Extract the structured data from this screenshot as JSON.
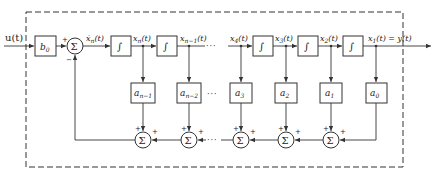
{
  "diagram": {
    "title": "",
    "type": "block-diagram",
    "input_label": "u(t)",
    "output_label": "x₁(t) = y(t)",
    "input_gain": {
      "label": "b",
      "sub": "0"
    },
    "main_sum": {
      "symbol": "Σ",
      "plus_sign": "+",
      "minus_sign": "−"
    },
    "derivative_label": {
      "text": "ẋ",
      "sub": "n",
      "arg": "(t)"
    },
    "integrator_symbol": "∫",
    "state_labels": [
      {
        "text": "x",
        "sub": "n",
        "arg": "(t)"
      },
      {
        "text": "x",
        "sub": "n−1",
        "arg": "(t)"
      },
      {
        "text": "x",
        "sub": "4",
        "arg": "(t)"
      },
      {
        "text": "x",
        "sub": "3",
        "arg": "(t)"
      },
      {
        "text": "x",
        "sub": "2",
        "arg": "(t)"
      },
      {
        "text": "x",
        "sub": "1",
        "arg": "(t) = y(t)"
      }
    ],
    "feedback_gains": [
      {
        "label": "a",
        "sub": "n−1"
      },
      {
        "label": "a",
        "sub": "n−2"
      },
      {
        "label": "a",
        "sub": "3"
      },
      {
        "label": "a",
        "sub": "2"
      },
      {
        "label": "a",
        "sub": "1"
      },
      {
        "label": "a",
        "sub": "0"
      }
    ],
    "feedback_sums": [
      {
        "symbol": "Σ",
        "signs": [
          "+",
          "+"
        ]
      },
      {
        "symbol": "Σ",
        "signs": [
          "+",
          "+"
        ]
      },
      {
        "symbol": "Σ",
        "signs": [
          "+",
          "+"
        ]
      },
      {
        "symbol": "Σ",
        "signs": [
          "+",
          "+"
        ]
      },
      {
        "symbol": "Σ",
        "signs": [
          "+",
          "+"
        ]
      }
    ],
    "ellipsis": "···",
    "colors": {
      "line": "#333333",
      "background": "#ffffff"
    }
  }
}
